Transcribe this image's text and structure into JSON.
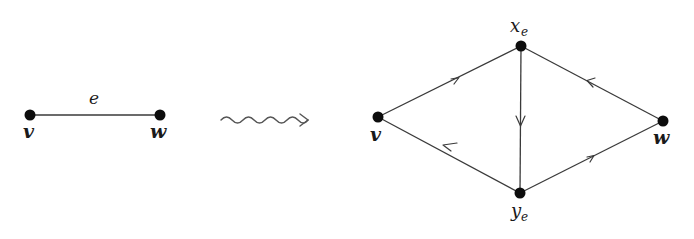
{
  "diagram": {
    "type": "graph-transformation",
    "colors": {
      "node": "#0d0d0d",
      "edge": "#3a3a3a",
      "squiggle": "#555555",
      "background": "#ffffff"
    },
    "left_graph": {
      "nodes": [
        {
          "id": "v",
          "label": "v",
          "x": 30,
          "y": 115
        },
        {
          "id": "w",
          "label": "w",
          "x": 160,
          "y": 115
        }
      ],
      "edges": [
        {
          "from": "v",
          "to": "w",
          "label": "e",
          "directed": false
        }
      ]
    },
    "transform_arrow": {
      "style": "squiggly",
      "from_x": 220,
      "to_x": 308,
      "y": 120
    },
    "right_graph": {
      "nodes": [
        {
          "id": "v",
          "label": "v",
          "x": 378,
          "y": 117
        },
        {
          "id": "xe",
          "label": "x",
          "subscript": "e",
          "x": 521,
          "y": 46
        },
        {
          "id": "ye",
          "label": "y",
          "subscript": "e",
          "x": 520,
          "y": 193
        },
        {
          "id": "w",
          "label": "w",
          "x": 663,
          "y": 121
        }
      ],
      "edges": [
        {
          "from": "v",
          "to": "xe",
          "directed": true
        },
        {
          "from": "xe",
          "to": "ye",
          "directed": true
        },
        {
          "from": "ye",
          "to": "v",
          "directed": true
        },
        {
          "from": "ye",
          "to": "w",
          "directed": true
        },
        {
          "from": "w",
          "to": "xe",
          "directed": true
        }
      ]
    },
    "labels": {
      "left_v": "v",
      "left_w": "w",
      "left_e": "e",
      "right_v": "v",
      "right_w": "w",
      "right_xe_base": "x",
      "right_xe_sub": "e",
      "right_ye_base": "y",
      "right_ye_sub": "e"
    }
  }
}
